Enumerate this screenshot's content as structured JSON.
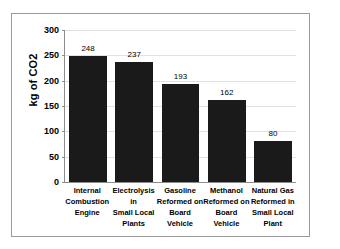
{
  "chart_data": {
    "type": "bar",
    "title": "",
    "subtitle": "",
    "xlabel": "",
    "ylabel": "kg of CO2",
    "ylim": [
      0,
      300
    ],
    "yticks": [
      0,
      50,
      100,
      150,
      200,
      250,
      300
    ],
    "ytick_labels": [
      "0",
      "50",
      "100",
      "150",
      "200",
      "250",
      "300"
    ],
    "grid": true,
    "legend": false,
    "legend_position": "none",
    "categories": [
      "Internal Combustion Engine",
      "Electrolysis in Small Local Plants",
      "Gasoline Reformed on Board Vehicle",
      "Methanol Reformed on Board Vehicle",
      "Natural Gas Reformed in Small Local Plant"
    ],
    "category_lines": [
      [
        "Internal",
        "Combustion",
        "Engine"
      ],
      [
        "Electrolysis in",
        "Small Local",
        "Plants"
      ],
      [
        "Gasoline",
        "Reformed on",
        "Board Vehicle"
      ],
      [
        "Methanol",
        "Reformed on",
        "Board Vehicle"
      ],
      [
        "Natural Gas",
        "Reformed in",
        "Small Local",
        "Plant"
      ]
    ],
    "values": [
      248,
      237,
      193,
      162,
      80
    ],
    "data_labels": [
      "248",
      "237",
      "193",
      "162",
      "80"
    ],
    "bar_color": "#1a1a1a",
    "grid_color": "#e2e2e2",
    "axis_color": "#8d8d8d",
    "frame_color": "#9a9a9a",
    "background_color": "#ffffff"
  }
}
